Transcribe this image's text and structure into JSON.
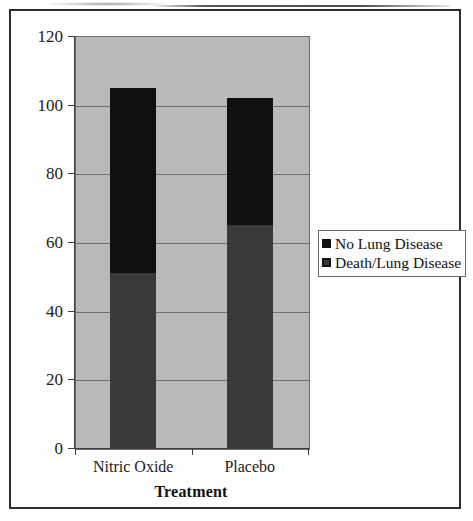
{
  "chart_data": {
    "type": "bar",
    "subtype": "stacked-column",
    "title": "",
    "xlabel": "Treatment",
    "ylabel": "",
    "categories": [
      "Nitric Oxide",
      "Placebo"
    ],
    "series": [
      {
        "name": "Death/Lung Disease",
        "color": "#3a3a3a",
        "values": [
          51,
          65
        ]
      },
      {
        "name": "No Lung Disease",
        "color": "#101010",
        "values": [
          54,
          37
        ]
      }
    ],
    "stack_totals": [
      105,
      102
    ],
    "ylim": [
      0,
      120
    ],
    "ytick_labels": [
      "0",
      "20",
      "40",
      "60",
      "80",
      "100",
      "120"
    ],
    "ytick_values": [
      0,
      20,
      40,
      60,
      80,
      100,
      120
    ],
    "grid": true,
    "grid_axis": "y",
    "legend_position": "right",
    "legend_entries": [
      "No Lung Disease",
      "Death/Lung Disease"
    ],
    "plot_background": "#b9b9b9",
    "page_background": "#ffffff",
    "frame_color": "#2e2e2e"
  },
  "axes": {
    "y": {
      "ticks": [
        {
          "label": "120",
          "value": 120
        },
        {
          "label": "100",
          "value": 100
        },
        {
          "label": "80",
          "value": 80
        },
        {
          "label": "60",
          "value": 60
        },
        {
          "label": "40",
          "value": 40
        },
        {
          "label": "20",
          "value": 20
        },
        {
          "label": "0",
          "value": 0
        }
      ]
    },
    "x": {
      "title": "Treatment",
      "ticks": [
        {
          "label": "Nitric Oxide"
        },
        {
          "label": "Placebo"
        }
      ]
    }
  },
  "legend": {
    "items": [
      {
        "label": "No Lung Disease",
        "color": "#101010",
        "style": "solid"
      },
      {
        "label": "Death/Lung Disease",
        "color": "#3a3a3a",
        "style": "inner"
      }
    ]
  }
}
